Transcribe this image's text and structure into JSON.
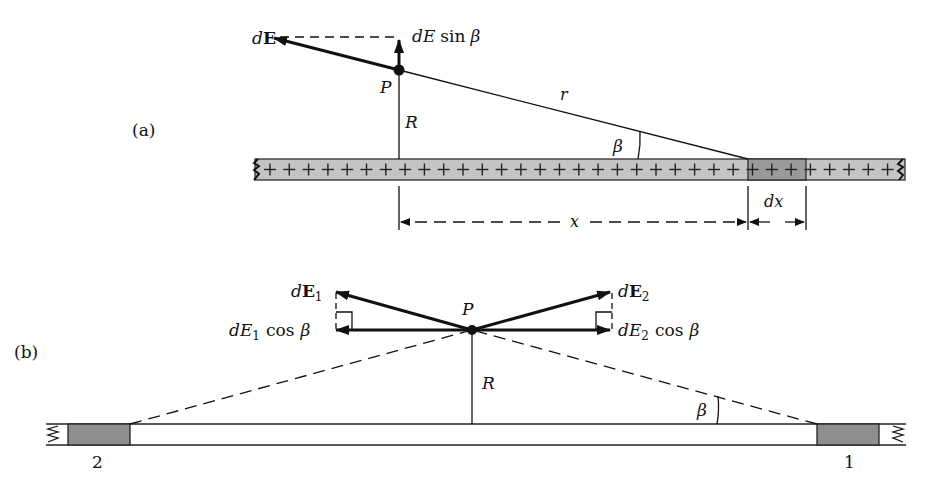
{
  "figure": {
    "panel_a": {
      "label": "(a)",
      "point_label": "P",
      "vector_label_d": "d",
      "vector_label_E": "E",
      "component_label": "dE sin β",
      "component_d": "d",
      "component_E": "E",
      "component_sin": "sin",
      "component_beta": "β",
      "distance_R": "R",
      "distance_r": "r",
      "angle_label": "β",
      "x_label": "x",
      "dx_label": "dx",
      "charge_sign": "+"
    },
    "panel_b": {
      "label": "(b)",
      "point_label": "P",
      "vec1_d": "d",
      "vec1_E": "E",
      "vec1_sub": "1",
      "vec2_d": "d",
      "vec2_E": "E",
      "vec2_sub": "2",
      "comp1_d": "d",
      "comp1_E": "E",
      "comp1_sub": "1",
      "comp1_cos": "cos",
      "comp1_beta": "β",
      "comp2_d": "d",
      "comp2_E": "E",
      "comp2_sub": "2",
      "comp2_cos": "cos",
      "comp2_beta": "β",
      "distance_R": "R",
      "angle_label": "β",
      "element_1": "1",
      "element_2": "2"
    },
    "colors": {
      "rod_fill": "#c4c4c4",
      "rod_dx_fill": "#9a9a9a",
      "element_fill": "#8e8e8e",
      "ink": "#111111"
    }
  }
}
